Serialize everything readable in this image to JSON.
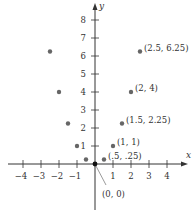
{
  "chart_data": {
    "type": "scatter",
    "title": "",
    "xlabel": "x",
    "ylabel": "y",
    "xlim": [
      -5,
      5
    ],
    "ylim": [
      -1,
      9
    ],
    "grid": false,
    "x_ticks": [
      -4,
      -3,
      -2,
      -1,
      1,
      2,
      3,
      4
    ],
    "y_ticks": [
      1,
      2,
      3,
      4,
      5,
      6,
      7,
      8
    ],
    "points": [
      {
        "x": -2.5,
        "y": 6.25,
        "label": ""
      },
      {
        "x": -2,
        "y": 4,
        "label": ""
      },
      {
        "x": -1.5,
        "y": 2.25,
        "label": ""
      },
      {
        "x": -1,
        "y": 1,
        "label": ""
      },
      {
        "x": -0.5,
        "y": 0.25,
        "label": ""
      },
      {
        "x": 0,
        "y": 0,
        "label": "(0, 0)"
      },
      {
        "x": 0.5,
        "y": 0.25,
        "label": "(.5, .25)"
      },
      {
        "x": 1,
        "y": 1,
        "label": "(1, 1)"
      },
      {
        "x": 1.5,
        "y": 2.25,
        "label": "(1.5, 2.25)"
      },
      {
        "x": 2,
        "y": 4,
        "label": "(2, 4)"
      },
      {
        "x": 2.5,
        "y": 6.25,
        "label": "(2.5, 6.25)"
      }
    ],
    "point_color": "#666666",
    "origin_color": "#111111"
  }
}
